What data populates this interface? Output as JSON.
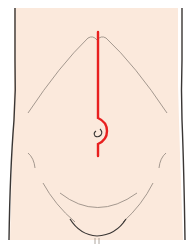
{
  "figure": {
    "colors": {
      "background": "#ffffff",
      "skin": "#fbe9dc",
      "outline": "#3a3634",
      "contour": "#9a8f86",
      "incision": "#e8201f"
    },
    "annotations": {
      "incision": "vertical midline incision curving around umbilicus",
      "umbilicus": "umbilicus"
    }
  }
}
